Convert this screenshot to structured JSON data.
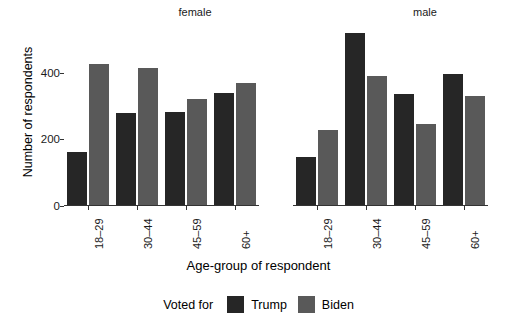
{
  "chart_data": {
    "type": "bar",
    "title": "",
    "xlabel": "Age-group of respondent",
    "ylabel": "Number of respondents",
    "ylim": [
      0,
      540
    ],
    "yticks": [
      0,
      200,
      400
    ],
    "ytick_labels": [
      "0",
      "200",
      "400"
    ],
    "grid": false,
    "legend_title": "Voted for",
    "legend_position": "bottom",
    "facet_labels": [
      "female",
      "male"
    ],
    "categories": [
      "18-29",
      "30-44",
      "45-59",
      "60+"
    ],
    "facets": [
      {
        "name": "female",
        "series": [
          {
            "name": "Trump",
            "color": "#262626",
            "values": [
              162,
              278,
              283,
              340
            ]
          },
          {
            "name": "Biden",
            "color": "#595959",
            "values": [
              425,
              415,
              320,
              368
            ]
          }
        ]
      },
      {
        "name": "male",
        "series": [
          {
            "name": "Trump",
            "color": "#262626",
            "values": [
              148,
              518,
              335,
              397
            ]
          },
          {
            "name": "Biden",
            "color": "#595959",
            "values": [
              228,
              390,
              245,
              330
            ]
          }
        ]
      }
    ]
  },
  "legend": {
    "title": "Voted for",
    "entries": [
      {
        "label": "Trump",
        "color": "#262626"
      },
      {
        "label": "Biden",
        "color": "#595959"
      }
    ]
  },
  "axes": {
    "y_title": "Number of respondents",
    "x_title": "Age-group of respondent"
  }
}
